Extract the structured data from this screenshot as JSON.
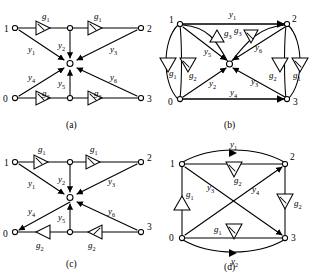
{
  "figure": {
    "ink_color": "#000000",
    "background_color": "#ffffff"
  },
  "panels": [
    {
      "id": "a",
      "caption": "(a)",
      "node_labels": [
        "1",
        "2",
        "0",
        "3"
      ],
      "edge_labels": [
        "y1",
        "y2",
        "y3",
        "y4",
        "y5",
        "y6"
      ],
      "gain_labels": [
        "g1",
        "g1",
        "g2",
        "g2"
      ]
    },
    {
      "id": "b",
      "caption": "(b)",
      "node_labels": [
        "1",
        "2",
        "0",
        "3"
      ],
      "edge_labels": [
        "y1",
        "y2",
        "y3",
        "y4",
        "y5",
        "y6"
      ],
      "gain_labels": [
        "g1",
        "g2",
        "g3",
        "g3",
        "g2",
        "g1"
      ]
    },
    {
      "id": "c",
      "caption": "(c)",
      "node_labels": [
        "1",
        "2",
        "0",
        "3"
      ],
      "edge_labels": [
        "y1",
        "y2",
        "y3",
        "y4",
        "y5",
        "y6"
      ],
      "gain_labels": [
        "g1",
        "g1",
        "g2",
        "g2"
      ]
    },
    {
      "id": "d",
      "caption": "(d)",
      "node_labels": [
        "1",
        "2",
        "0",
        "3"
      ],
      "edge_labels": [
        "y1",
        "y2",
        "y3",
        "y4"
      ],
      "gain_labels": [
        "g1",
        "g2",
        "g2",
        "g1"
      ]
    }
  ],
  "labels": {
    "y1": {
      "base": "y",
      "sub": "1"
    },
    "y2": {
      "base": "y",
      "sub": "2"
    },
    "y3": {
      "base": "y",
      "sub": "3"
    },
    "y4": {
      "base": "y",
      "sub": "4"
    },
    "y5": {
      "base": "y",
      "sub": "5"
    },
    "y6": {
      "base": "y",
      "sub": "6"
    },
    "g1": {
      "base": "g",
      "sub": "1"
    },
    "g2": {
      "base": "g",
      "sub": "2"
    },
    "g3": {
      "base": "g",
      "sub": "3"
    },
    "n0": "0",
    "n1": "1",
    "n2": "2",
    "n3": "3",
    "cap_a": "(a)",
    "cap_b": "(b)",
    "cap_c": "(c)",
    "cap_d": "(d)"
  }
}
